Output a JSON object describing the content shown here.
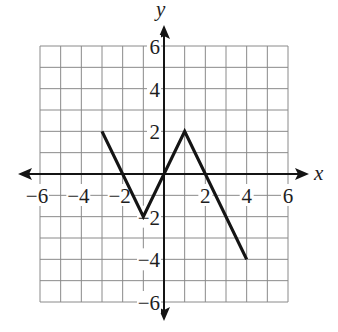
{
  "chart_data": {
    "type": "line",
    "title": "",
    "xlabel": "x",
    "ylabel": "y",
    "xlim": [
      -6,
      6
    ],
    "ylim": [
      -6,
      6
    ],
    "grid": true,
    "grid_step": 1,
    "x_ticks": [
      -6,
      -4,
      -2,
      2,
      4,
      6
    ],
    "y_ticks": [
      6,
      4,
      2,
      -2,
      -4,
      -6
    ],
    "x_tick_labels": [
      "−6",
      "−4",
      "−2",
      "2",
      "4",
      "6"
    ],
    "y_tick_labels": [
      "6",
      "4",
      "2",
      "−2",
      "−4",
      "−6"
    ],
    "series": [
      {
        "name": "f(x)",
        "points": [
          [
            -3,
            2
          ],
          [
            -1,
            -2
          ],
          [
            1,
            2
          ],
          [
            4,
            -4
          ]
        ]
      }
    ],
    "axis_arrows": true,
    "colors": {
      "line": "#141414",
      "grid": "#8a8a8a",
      "background": "#ffffff"
    }
  }
}
